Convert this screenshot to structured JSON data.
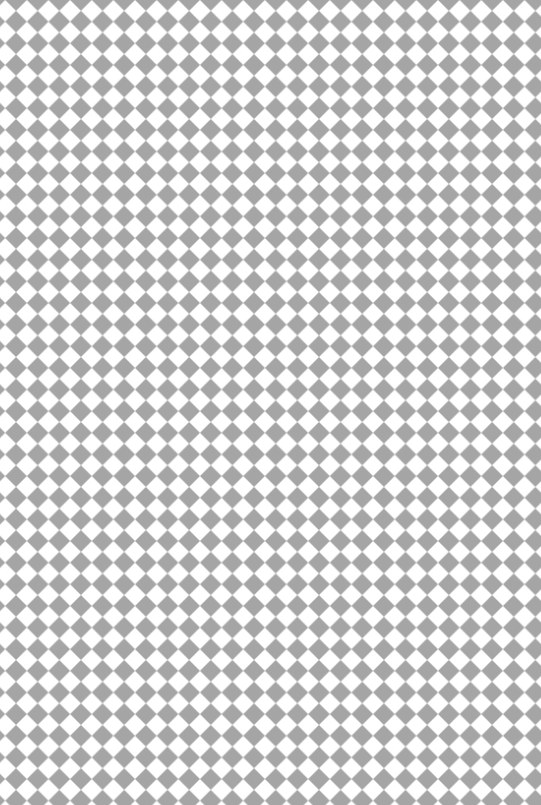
{
  "pattern": {
    "type": "diamond-checkerboard",
    "description": "Argyle / harlequin diamond tile pattern",
    "foreground_color": "#a5a5a5",
    "background_color": "#ffffff",
    "period_px": 21.64,
    "offset_x": 5.2,
    "offset_y": -10.82,
    "columns": 25,
    "rows": 37
  }
}
